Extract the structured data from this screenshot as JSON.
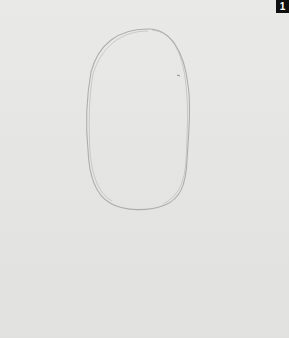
{
  "step_badge": "1",
  "colors": {
    "paper": "#e6e6e4",
    "pencil": "#9a9a98",
    "badge_bg": "#0f0f0f",
    "badge_fg": "#ffffff"
  }
}
